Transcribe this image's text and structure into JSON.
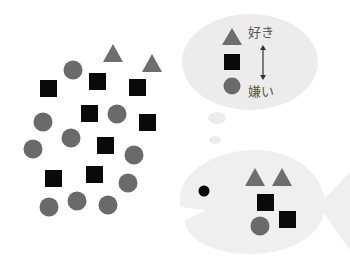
{
  "colors": {
    "background": "#ffffff",
    "bubble": "#ececec",
    "fish": "#efefef",
    "triangle": "#6e6e6e",
    "square": "#0a0a0a",
    "circle": "#6a6a6a",
    "eye": "#0a0a0a",
    "text": "#555555"
  },
  "thought_bubble": {
    "like_label": "好き",
    "dislike_label": "嫌い",
    "ranking": [
      "triangle",
      "square",
      "circle"
    ]
  },
  "scattered_shapes": {
    "triangles": 2,
    "squares": 9,
    "circles": 11
  },
  "fish_stomach": {
    "triangles": 2,
    "squares": 2,
    "circles": 1
  }
}
